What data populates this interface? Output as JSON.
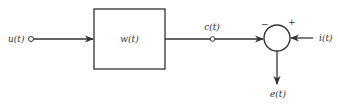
{
  "diagram": {
    "input": {
      "label": "u(t)"
    },
    "block": {
      "label": "w(t)"
    },
    "output_node": {
      "label": "c(t)"
    },
    "summing_junction": {
      "minus_sign": "−",
      "plus_sign": "+"
    },
    "reference_input": {
      "label": "i(t)"
    },
    "error_output": {
      "label": "e(t)"
    },
    "colors": {
      "stroke": "#333333",
      "background": "#ffffff"
    }
  }
}
